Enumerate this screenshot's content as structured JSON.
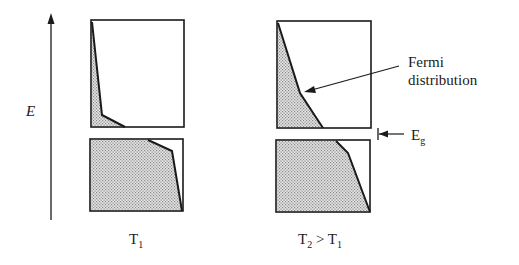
{
  "diagram": {
    "axis": {
      "label": "E"
    },
    "panels": [
      {
        "id": "T1",
        "label_main": "T",
        "label_sub": "1",
        "label_tail": ""
      },
      {
        "id": "T2",
        "label_main": "T",
        "label_sub": "2",
        "label_tail": " > T",
        "label_tail_sub": "1"
      }
    ],
    "annotations": {
      "fermi_line1": "Fermi",
      "fermi_line2": "distribution",
      "gap_main": "E",
      "gap_sub": "g"
    },
    "colors": {
      "outline": "#1a1a1a",
      "fill": "#c8c8c8",
      "background": "#ffffff"
    }
  }
}
